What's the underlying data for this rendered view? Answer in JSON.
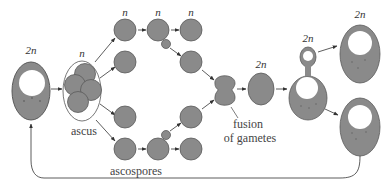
{
  "colors": {
    "cell_fill": "#8a8a8a",
    "cell_stroke": "#5a5a5a",
    "nucleus_fill": "#ffffff",
    "arrow": "#333333",
    "text": "#333333"
  },
  "labels": {
    "diploid_start": "2n",
    "ascus_ploidy": "n",
    "spore_top_1": "n",
    "spore_top_2": "n",
    "spore_top_3": "n",
    "zygote": "2n",
    "budding": "2n",
    "daughter": "2n",
    "ascus": "ascus",
    "ascospores": "ascospores",
    "fusion_line1": "fusion",
    "fusion_line2": "of gametes"
  },
  "stages": [
    {
      "name": "diploid-cell",
      "ploidy": "2n"
    },
    {
      "name": "ascus",
      "ploidy": "n",
      "spores": 4
    },
    {
      "name": "ascospores",
      "ploidy": "n"
    },
    {
      "name": "haploid-budding",
      "ploidy": "n"
    },
    {
      "name": "fusion-of-gametes"
    },
    {
      "name": "zygote",
      "ploidy": "2n"
    },
    {
      "name": "diploid-budding",
      "ploidy": "2n"
    },
    {
      "name": "diploid-daughter-cells",
      "ploidy": "2n",
      "count": 2
    }
  ]
}
